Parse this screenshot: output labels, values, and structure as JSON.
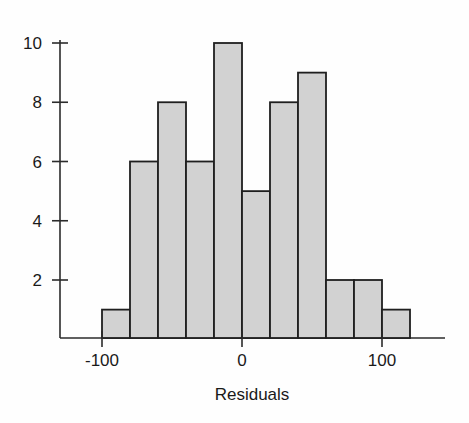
{
  "figure": {
    "background_color": "#fefefe",
    "axis_color": "#2b2b2b",
    "bar_fill_color": "#d2d2d2",
    "bar_border_color": "#1f1f1f",
    "text_color": "#1a1a1a"
  },
  "chart_data": {
    "type": "bar",
    "title": "",
    "subtitle": "",
    "xlabel": "Residuals",
    "ylabel": "",
    "grid": false,
    "legend": null,
    "bin_width": 20,
    "categories": [
      "-100 to -80",
      "-80 to -60",
      "-60 to -40",
      "-40 to -20",
      "-20 to 0",
      "0 to 20",
      "20 to 40",
      "40 to 60",
      "60 to 80",
      "80 to 100",
      "100 to 120"
    ],
    "bin_edges": [
      -100,
      -80,
      -60,
      -40,
      -20,
      0,
      20,
      40,
      60,
      80,
      100,
      120
    ],
    "values": [
      1,
      6,
      8,
      6,
      10,
      5,
      8,
      9,
      2,
      2,
      1
    ],
    "xlim": [
      -110,
      130
    ],
    "ylim": [
      0,
      10.6
    ],
    "x_ticks": [
      -100,
      0,
      100
    ],
    "x_tick_labels": [
      "-100",
      "0",
      "100"
    ],
    "y_ticks": [
      2,
      4,
      6,
      8,
      10
    ],
    "y_tick_labels": [
      "2",
      "4",
      "6",
      "8",
      "10"
    ],
    "total_count": 59
  }
}
